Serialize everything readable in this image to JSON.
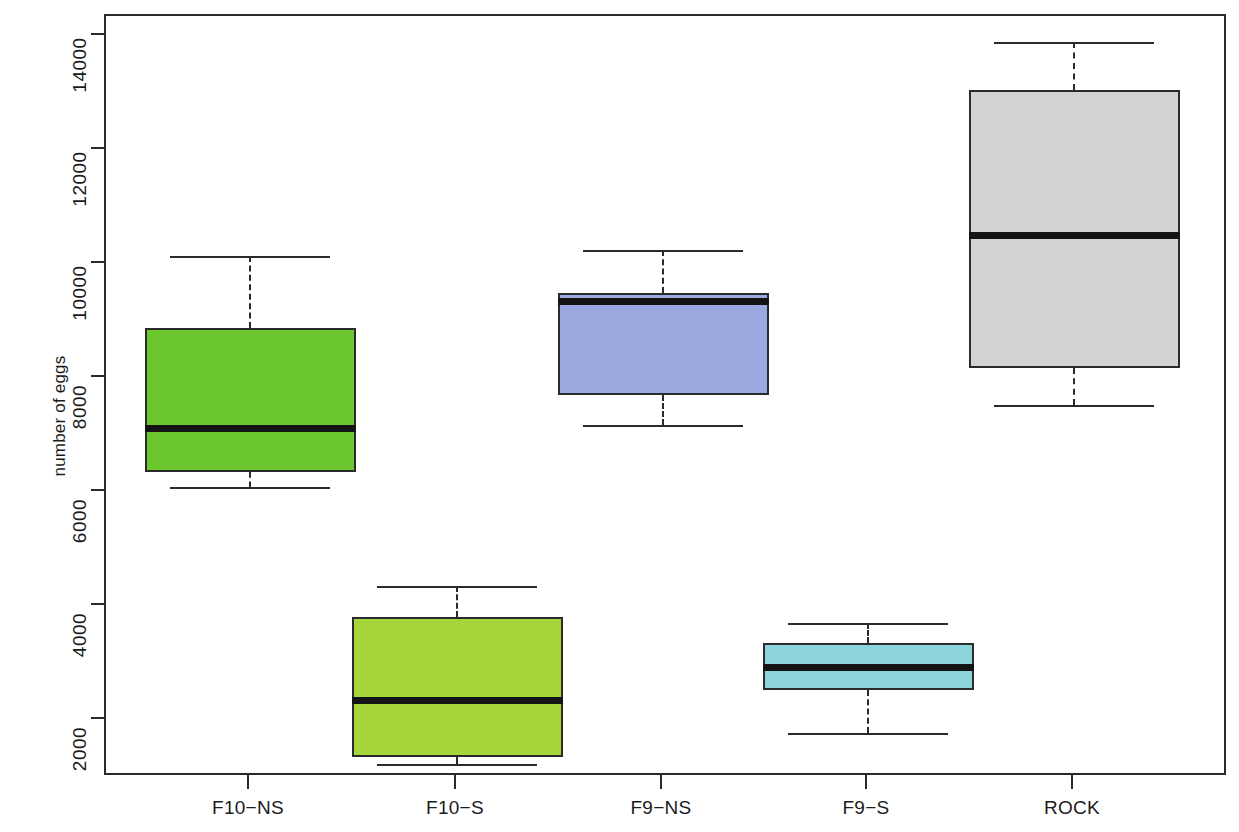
{
  "chart_data": {
    "type": "box",
    "title": "",
    "xlabel": "",
    "ylabel": "number of eggs",
    "ylim": [
      600,
      14400
    ],
    "yticks": [
      2000,
      4000,
      6000,
      8000,
      10000,
      12000,
      14000
    ],
    "ytick_labels": [
      "2000",
      "4000",
      "6000",
      "8000",
      "10000",
      "12000",
      "14000"
    ],
    "categories": [
      "F10−NS",
      "F10−S",
      "F9−NS",
      "F9−S",
      "ROCK"
    ],
    "grid": false,
    "legend": "none",
    "boxes": [
      {
        "label": "F10−NS",
        "color": "#6CC62E",
        "whisker_low": 6080,
        "q1": 6350,
        "median": 7120,
        "q3": 8870,
        "whisker_high": 10140
      },
      {
        "label": "F10−S",
        "color": "#A7D63C",
        "whisker_low": 1220,
        "q1": 1350,
        "median": 2350,
        "q3": 3800,
        "whisker_high": 4350
      },
      {
        "label": "F9−NS",
        "color": "#9BA9E0",
        "whisker_low": 7180,
        "q1": 7700,
        "median": 9350,
        "q3": 9500,
        "whisker_high": 10250
      },
      {
        "label": "F9−S",
        "color": "#8BD4DC",
        "whisker_low": 1780,
        "q1": 2520,
        "median": 2920,
        "q3": 3350,
        "whisker_high": 3700
      },
      {
        "label": "ROCK",
        "color": "#D2D2D2",
        "whisker_low": 7530,
        "q1": 8180,
        "median": 10500,
        "q3": 13050,
        "whisker_high": 13900
      }
    ]
  },
  "axis": {
    "y_label_text": "number of eggs"
  }
}
